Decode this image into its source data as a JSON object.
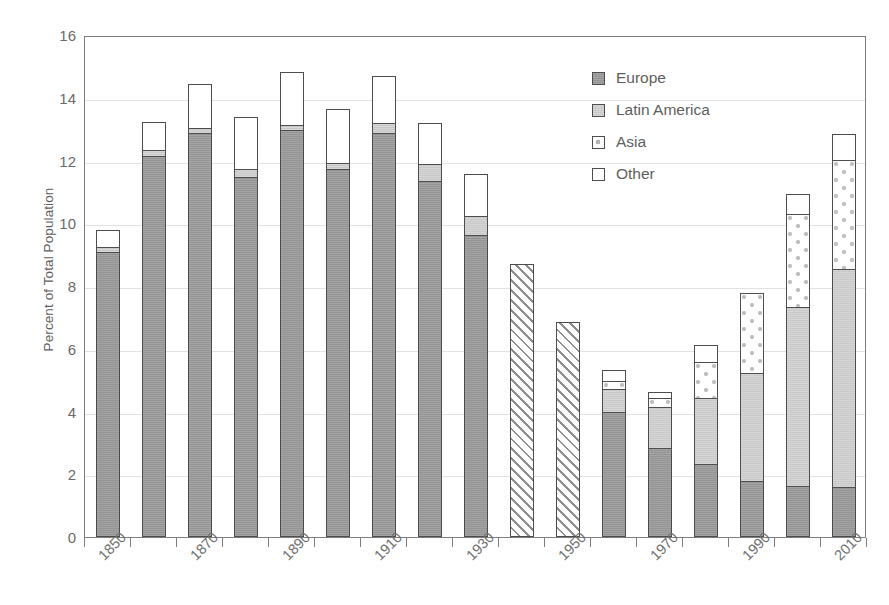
{
  "chart_data": {
    "type": "bar",
    "subtype": "stacked",
    "title": "",
    "xlabel": "",
    "ylabel": "Percent of Total Population",
    "ylim": [
      0,
      16
    ],
    "ytick_step": 2,
    "yticks": [
      "16",
      "14",
      "12",
      "10",
      "8",
      "6",
      "4",
      "2",
      "0"
    ],
    "grid": true,
    "grid_axis": "y",
    "legend_position": "top-right",
    "categories": [
      "1850",
      "1860",
      "1870",
      "1880",
      "1890",
      "1900",
      "1910",
      "1920",
      "1930",
      "1940",
      "1950",
      "1960",
      "1970",
      "1980",
      "1990",
      "2000",
      "2010"
    ],
    "xtick_labels_shown": [
      "1850",
      "1870",
      "1890",
      "1910",
      "1930",
      "1950",
      "1970",
      "1990",
      "2010"
    ],
    "series": [
      {
        "name": "Europe",
        "color": "#9a9a9a",
        "pattern": "solid-dark-gray",
        "values": [
          9.05,
          12.1,
          12.85,
          11.45,
          12.95,
          11.7,
          12.85,
          11.3,
          9.6,
          null,
          null,
          3.95,
          2.8,
          2.3,
          1.75,
          1.6,
          1.55
        ]
      },
      {
        "name": "Latin America",
        "color": "#cfcfcf",
        "pattern": "solid-light-gray",
        "values": [
          0.15,
          0.2,
          0.15,
          0.25,
          0.15,
          0.2,
          0.3,
          0.55,
          0.6,
          null,
          null,
          0.75,
          1.3,
          2.1,
          3.45,
          5.7,
          6.95
        ]
      },
      {
        "name": "Asia",
        "color": "#ffffff",
        "pattern": "dotted-diamond",
        "values": [
          0.0,
          0.0,
          0.0,
          0.0,
          0.0,
          0.0,
          0.0,
          0.0,
          0.0,
          null,
          null,
          0.25,
          0.3,
          1.15,
          2.55,
          2.95,
          3.5
        ]
      },
      {
        "name": "Other",
        "color": "#ffffff",
        "pattern": "white",
        "values": [
          0.55,
          0.9,
          1.4,
          1.65,
          1.7,
          1.7,
          1.5,
          1.3,
          1.35,
          null,
          null,
          0.35,
          0.2,
          0.55,
          0.0,
          0.65,
          0.8
        ]
      }
    ],
    "unbroken_totals": {
      "note": "1940 and 1950 shown as diagonally hatched totals only",
      "pattern": "diagonal-hatch",
      "values": {
        "1940": 8.7,
        "1950": 6.85
      }
    },
    "totals": [
      9.75,
      13.2,
      14.4,
      13.35,
      14.8,
      13.6,
      14.65,
      13.15,
      11.55,
      8.7,
      6.85,
      5.3,
      4.6,
      6.1,
      7.75,
      10.9,
      12.8
    ]
  },
  "legend": {
    "items": [
      {
        "label": "Europe",
        "swatch": "solid-dark-gray"
      },
      {
        "label": "Latin America",
        "swatch": "solid-light-gray"
      },
      {
        "label": "Asia",
        "swatch": "dotted-diamond"
      },
      {
        "label": "Other",
        "swatch": "white"
      }
    ]
  },
  "axes": {
    "y_title": "Percent of Total Population"
  }
}
